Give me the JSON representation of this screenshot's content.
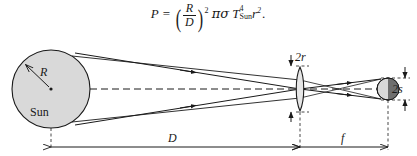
{
  "figure": {
    "type": "optics-ray-diagram",
    "caption_equation": {
      "lhs": "P",
      "equals": "=",
      "fraction_numerator": "R",
      "fraction_denominator": "D",
      "paren_exponent": "2",
      "pi": "π",
      "sigma": "σ",
      "temperature_symbol": "T",
      "temperature_subscript": "Sun",
      "temperature_exponent": "4",
      "radius_symbol": "r",
      "radius_exponent": "2",
      "period": "."
    },
    "labels": {
      "sun_radius": "R",
      "sun_body": "Sun",
      "lens_aperture": "2r",
      "image_size": "2s",
      "distance_sun_lens": "D",
      "focal_length": "f"
    },
    "colors": {
      "sun_fill": "#d9d9d9",
      "outline": "#1a1a1a",
      "image_disc_light": "#d9d9d9",
      "image_disc_dark": "#6e6e6e",
      "lens_fill": "#e6e6e6",
      "background": "#ffffff"
    },
    "geometry": {
      "sun_center_x": 51,
      "sun_center_y": 89,
      "sun_radius_px": 39,
      "lens_x": 300,
      "lens_half_height": 22,
      "image_center_x": 388,
      "image_radius_px": 11,
      "axis_y": 89,
      "dimension_line_y": 147,
      "D_from_x": 51,
      "D_to_x": 300,
      "f_from_x": 300,
      "f_to_x": 388
    }
  }
}
